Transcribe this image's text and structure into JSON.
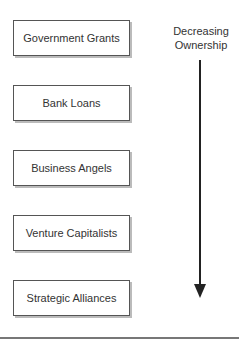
{
  "diagram": {
    "boxes": [
      {
        "label": "Government Grants"
      },
      {
        "label": "Bank Loans"
      },
      {
        "label": "Business Angels"
      },
      {
        "label": "Venture Capitalists"
      },
      {
        "label": "Strategic Alliances"
      }
    ],
    "arrow_label_line1": "Decreasing",
    "arrow_label_line2": "Ownership",
    "arrow_direction": "down"
  }
}
